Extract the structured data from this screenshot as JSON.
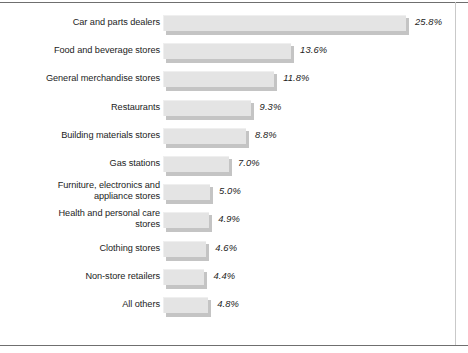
{
  "figure": {
    "name": "retail-sales-share-bar-chart",
    "background_color": "#ffffff",
    "frame_color": "#6f6f6f",
    "bar_fill_color": "#e4e4e4",
    "bar_shadow_color": "#c4c4c4",
    "text_color": "#1c1c1c"
  },
  "chart_data": {
    "type": "bar",
    "orientation": "horizontal",
    "title": "",
    "subtitle": "",
    "xlabel": "",
    "ylabel": "",
    "grid": false,
    "legend": false,
    "axis_visible": false,
    "value_suffix": "%",
    "value_label_style": "italic",
    "xlim": [
      0,
      25.8
    ],
    "categories": [
      "Car and parts dealers",
      "Food and beverage stores",
      "General merchandise stores",
      "Restaurants",
      "Building materials stores",
      "Gas stations",
      "Furniture, electronics and\nappliance stores",
      "Health and personal care\nstores",
      "Clothing stores",
      "Non-store retailers",
      "All others"
    ],
    "values": [
      25.8,
      13.6,
      11.8,
      9.3,
      8.8,
      7.0,
      5.0,
      4.9,
      4.6,
      4.4,
      4.8
    ],
    "value_labels": [
      "25.8%",
      "13.6%",
      "11.8%",
      "9.3%",
      "8.8%",
      "7.0%",
      "5.0%",
      "4.9%",
      "4.6%",
      "4.4%",
      "4.8%"
    ]
  },
  "rows": [
    {
      "label": "Car and parts dealers",
      "value": 25.8,
      "value_label": "25.8%",
      "lines": 1
    },
    {
      "label": "Food and beverage stores",
      "value": 13.6,
      "value_label": "13.6%",
      "lines": 1
    },
    {
      "label": "General merchandise stores",
      "value": 11.8,
      "value_label": "11.8%",
      "lines": 1
    },
    {
      "label": "Restaurants",
      "value": 9.3,
      "value_label": "9.3%",
      "lines": 1
    },
    {
      "label": "Building materials stores",
      "value": 8.8,
      "value_label": "8.8%",
      "lines": 1
    },
    {
      "label": "Gas stations",
      "value": 7.0,
      "value_label": "7.0%",
      "lines": 1
    },
    {
      "label": "Furniture, electronics and\nappliance stores",
      "value": 5.0,
      "value_label": "5.0%",
      "lines": 2
    },
    {
      "label": "Health and personal care\nstores",
      "value": 4.9,
      "value_label": "4.9%",
      "lines": 2
    },
    {
      "label": "Clothing stores",
      "value": 4.6,
      "value_label": "4.6%",
      "lines": 1
    },
    {
      "label": "Non-store retailers",
      "value": 4.4,
      "value_label": "4.4%",
      "lines": 1
    },
    {
      "label": "All others",
      "value": 4.8,
      "value_label": "4.8%",
      "lines": 1
    }
  ]
}
